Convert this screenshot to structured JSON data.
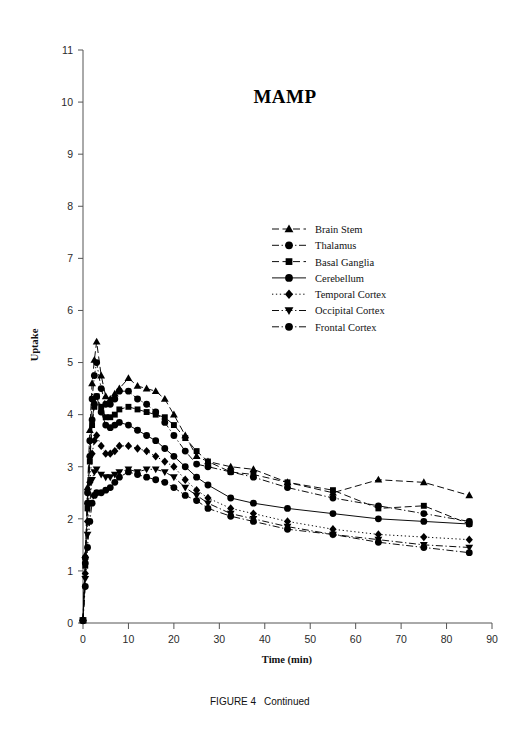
{
  "figure": {
    "caption_label": "FIGURE 4",
    "caption_text": "Continued"
  },
  "chart_data": {
    "type": "line",
    "title": "MAMP",
    "xlabel": "Time (min)",
    "ylabel": "Uptake",
    "xlim": [
      0,
      90
    ],
    "ylim": [
      0,
      11
    ],
    "xticks": [
      0,
      10,
      20,
      30,
      40,
      50,
      60,
      70,
      80,
      90
    ],
    "yticks": [
      0,
      1,
      2,
      3,
      4,
      5,
      6,
      7,
      8,
      9,
      10,
      11
    ],
    "grid": false,
    "legend_position": "upper-right-inside",
    "x": [
      0,
      0.5,
      1,
      1.5,
      2,
      2.5,
      3,
      4,
      5,
      6,
      7,
      8,
      10,
      12,
      14,
      16,
      18,
      20,
      22.5,
      25,
      27.5,
      32.5,
      37.5,
      45,
      55,
      65,
      75,
      85
    ],
    "series": [
      {
        "name": "Brain Stem",
        "marker": "triangle-up",
        "linestyle": "dashed",
        "values": [
          0.05,
          1.3,
          2.6,
          3.7,
          4.6,
          5.05,
          5.4,
          4.75,
          4.35,
          4.3,
          4.4,
          4.5,
          4.7,
          4.55,
          4.5,
          4.45,
          4.3,
          4.0,
          3.6,
          3.2,
          3.1,
          3.0,
          2.95,
          2.7,
          2.5,
          2.75,
          2.7,
          2.45
        ]
      },
      {
        "name": "Thalamus",
        "marker": "circle",
        "linestyle": "dashdot",
        "values": [
          0.05,
          1.25,
          2.5,
          3.5,
          4.3,
          4.75,
          5.0,
          4.5,
          4.2,
          4.2,
          4.3,
          4.45,
          4.45,
          4.3,
          4.2,
          4.05,
          3.85,
          3.6,
          3.3,
          3.05,
          3.0,
          2.9,
          2.8,
          2.6,
          2.4,
          2.25,
          2.1,
          1.95
        ]
      },
      {
        "name": "Basal Ganglia",
        "marker": "square",
        "linestyle": "dashed",
        "values": [
          0.05,
          1.1,
          2.2,
          3.1,
          3.8,
          4.15,
          4.35,
          4.15,
          3.95,
          3.95,
          4.0,
          4.1,
          4.15,
          4.1,
          4.05,
          4.0,
          3.95,
          3.8,
          3.55,
          3.3,
          3.1,
          2.9,
          2.85,
          2.7,
          2.55,
          2.2,
          2.25,
          1.9
        ]
      },
      {
        "name": "Cerebellum",
        "marker": "circle",
        "linestyle": "solid",
        "values": [
          0.05,
          1.15,
          2.3,
          3.2,
          3.9,
          4.2,
          4.35,
          4.05,
          3.8,
          3.75,
          3.8,
          3.85,
          3.8,
          3.7,
          3.6,
          3.5,
          3.35,
          3.2,
          3.0,
          2.8,
          2.65,
          2.4,
          2.3,
          2.2,
          2.1,
          2.0,
          1.95,
          1.9
        ]
      },
      {
        "name": "Temporal Cortex",
        "marker": "diamond",
        "linestyle": "dotted",
        "values": [
          0.05,
          0.95,
          1.95,
          2.7,
          3.25,
          3.5,
          3.6,
          3.4,
          3.25,
          3.25,
          3.3,
          3.4,
          3.4,
          3.35,
          3.3,
          3.2,
          3.1,
          3.0,
          2.75,
          2.55,
          2.4,
          2.2,
          2.1,
          1.95,
          1.8,
          1.7,
          1.65,
          1.6
        ]
      },
      {
        "name": "Occipital Cortex",
        "marker": "triangle-down",
        "linestyle": "dashdot",
        "values": [
          0.05,
          0.85,
          1.7,
          2.3,
          2.75,
          2.9,
          2.95,
          2.85,
          2.8,
          2.8,
          2.85,
          2.9,
          2.95,
          2.9,
          2.95,
          2.95,
          2.9,
          2.8,
          2.6,
          2.45,
          2.3,
          2.1,
          2.0,
          1.85,
          1.7,
          1.6,
          1.5,
          1.45
        ]
      },
      {
        "name": "Frontal Cortex",
        "marker": "circle",
        "linestyle": "dashdot",
        "values": [
          0.05,
          0.7,
          1.45,
          1.95,
          2.3,
          2.45,
          2.5,
          2.5,
          2.55,
          2.6,
          2.7,
          2.8,
          2.9,
          2.85,
          2.8,
          2.75,
          2.7,
          2.6,
          2.45,
          2.35,
          2.2,
          2.05,
          1.95,
          1.8,
          1.7,
          1.55,
          1.45,
          1.35
        ]
      }
    ]
  }
}
